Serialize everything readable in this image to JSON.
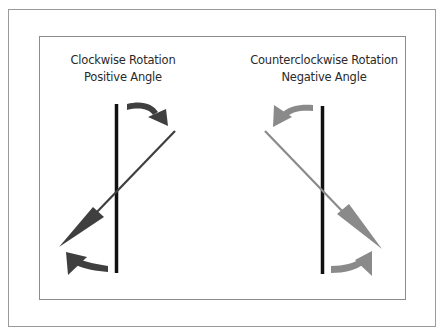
{
  "diagram": {
    "left_panel": {
      "title_line1": "Clockwise Rotation",
      "title_line2": "Positive Angle",
      "arrow_color": "#3f3f3f"
    },
    "right_panel": {
      "title_line1": "Counterclockwise Rotation",
      "title_line2": "Negative Angle",
      "arrow_color": "#8a8a8a"
    },
    "axis_color": "#111111",
    "frame_color": "#9a9a9a"
  }
}
